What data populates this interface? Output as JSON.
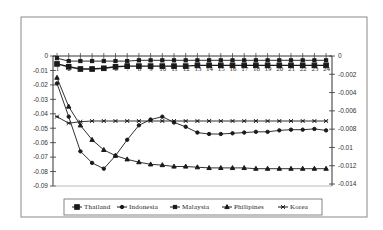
{
  "chart_data": {
    "type": "line",
    "title": "",
    "xlabel": "",
    "ylabel": "",
    "x": [
      1,
      2,
      3,
      4,
      5,
      6,
      7,
      8,
      9,
      10,
      11,
      12,
      13,
      14,
      15,
      16,
      17,
      18,
      19,
      20,
      21,
      22,
      23,
      24
    ],
    "categories": [
      "1",
      "2",
      "3",
      "4",
      "5",
      "6",
      "7",
      "8",
      "9",
      "10",
      "11",
      "12",
      "13",
      "14",
      "15",
      "16",
      "17",
      "18",
      "19",
      "20",
      "21",
      "22",
      "23",
      "24"
    ],
    "ylim": [
      -0.09,
      0
    ],
    "y_ticks": [
      "0",
      "-0.01",
      "-0.02",
      "-0.03",
      "-0.04",
      "-0.05",
      "-0.06",
      "-0.07",
      "-0.08",
      "-0.09"
    ],
    "y2lim": [
      -0.014,
      0
    ],
    "y2_ticks": [
      "0",
      "-0.002",
      "-0.004",
      "-0.006",
      "-0.008",
      "-0.01",
      "-0.012",
      "-0.014"
    ],
    "grid": false,
    "legend_position": "bottom",
    "series": [
      {
        "name": "Thailand",
        "marker": "square-large",
        "values": [
          -0.0055,
          -0.0075,
          -0.009,
          -0.009,
          -0.0085,
          -0.0075,
          -0.007,
          -0.007,
          -0.007,
          -0.007,
          -0.007,
          -0.007,
          -0.0065,
          -0.0065,
          -0.0065,
          -0.0065,
          -0.0065,
          -0.0065,
          -0.0065,
          -0.0065,
          -0.0065,
          -0.0065,
          -0.0065,
          -0.0065
        ]
      },
      {
        "name": "Indonesia",
        "marker": "circle",
        "values": [
          -0.019,
          -0.042,
          -0.066,
          -0.074,
          -0.078,
          -0.069,
          -0.058,
          -0.048,
          -0.044,
          -0.042,
          -0.046,
          -0.049,
          -0.053,
          -0.054,
          -0.054,
          -0.0535,
          -0.053,
          -0.0525,
          -0.0525,
          -0.0515,
          -0.051,
          -0.051,
          -0.0505,
          -0.0515
        ]
      },
      {
        "name": "Malaysia",
        "marker": "square-small",
        "values": [
          -0.0015,
          -0.0035,
          -0.0035,
          -0.0035,
          -0.0035,
          -0.0035,
          -0.0035,
          -0.003,
          -0.003,
          -0.003,
          -0.003,
          -0.003,
          -0.003,
          -0.003,
          -0.003,
          -0.003,
          -0.003,
          -0.003,
          -0.003,
          -0.003,
          -0.003,
          -0.003,
          -0.003,
          -0.003
        ]
      },
      {
        "name": "Philipines",
        "marker": "triangle",
        "values": [
          -0.015,
          -0.035,
          -0.048,
          -0.058,
          -0.065,
          -0.069,
          -0.0715,
          -0.0735,
          -0.075,
          -0.0755,
          -0.0765,
          -0.0765,
          -0.077,
          -0.0775,
          -0.0775,
          -0.0775,
          -0.0775,
          -0.078,
          -0.078,
          -0.078,
          -0.078,
          -0.078,
          -0.078,
          -0.078
        ]
      },
      {
        "name": "Korea",
        "marker": "x",
        "values": [
          -0.042,
          -0.0465,
          -0.0455,
          -0.045,
          -0.045,
          -0.045,
          -0.045,
          -0.045,
          -0.045,
          -0.045,
          -0.045,
          -0.045,
          -0.045,
          -0.045,
          -0.045,
          -0.045,
          -0.045,
          -0.045,
          -0.045,
          -0.045,
          -0.045,
          -0.045,
          -0.045,
          -0.045
        ]
      }
    ],
    "colors": {
      "line": "#1a1a1a",
      "frame": "#8a8a8a",
      "axis": "#333333",
      "background": "#ffffff"
    }
  }
}
